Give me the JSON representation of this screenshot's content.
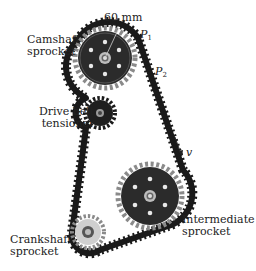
{
  "diagram": {
    "labels": {
      "camshaft": [
        "Camshaft",
        "sprocket"
      ],
      "tensioner": [
        "Drive belt",
        "tensioner"
      ],
      "intermediate": [
        "Intermediate",
        "sprocket"
      ],
      "crankshaft": [
        "Crankshaft",
        "sprocket"
      ],
      "radius": "60 mm",
      "p1": "P",
      "p1_sub": "1",
      "p2": "P",
      "p2_sub": "2",
      "velocity": "v"
    },
    "colors": {
      "belt": "#1a1a1a",
      "sprocket_body": "#2b2b2b",
      "sprocket_teeth": "#8a8a8a",
      "hub": "#bdbdbd",
      "text": "#222222"
    }
  }
}
